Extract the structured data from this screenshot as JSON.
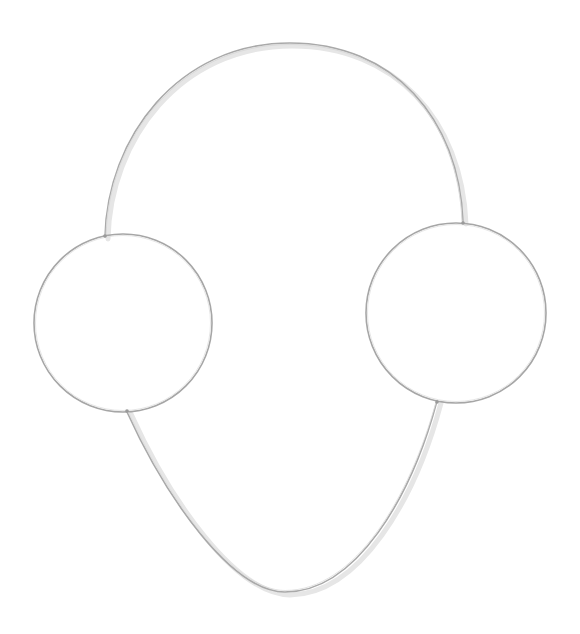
{
  "image": {
    "subject": "Silver wire necklace with two circular hoops",
    "background_color": "#ffffff",
    "wire_color": "#a9a9a9",
    "wire_highlight": "#d6d6d6",
    "shadow_color": "#e4e4e4"
  },
  "geometry": {
    "top_arc": {
      "start": [
        105,
        237
      ],
      "apex": [
        290,
        43
      ],
      "end": [
        463,
        222
      ]
    },
    "left_hoop": {
      "cx": 123,
      "cy": 323,
      "r": 89
    },
    "right_hoop": {
      "cx": 456,
      "cy": 313,
      "r": 90
    },
    "bottom_curve": {
      "start": [
        127,
        412
      ],
      "bottom": [
        285,
        592
      ],
      "end": [
        437,
        401
      ]
    }
  }
}
